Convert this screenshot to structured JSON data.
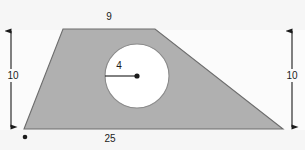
{
  "figure": {
    "canvas": {
      "width": 305,
      "height": 150
    },
    "colors": {
      "background": "#f6f6f6",
      "background_band": "#fbfbfb",
      "shape_fill": "#b0b0b0",
      "shape_stroke": "#6d6d6d",
      "hole_fill": "#ffffff",
      "hole_stroke": "#8a8a8a",
      "annotation": "#1b1b1b"
    },
    "shape": {
      "name": "trapezoid",
      "vertices": [
        {
          "x": 63,
          "y": 29
        },
        {
          "x": 155,
          "y": 29
        },
        {
          "x": 283,
          "y": 129
        },
        {
          "x": 24,
          "y": 129
        }
      ]
    },
    "hole": {
      "name": "circle",
      "center": {
        "x": 137,
        "y": 76
      },
      "radius_px": 32
    },
    "radius_line": {
      "from": {
        "x": 105,
        "y": 76
      },
      "to": {
        "x": 137,
        "y": 76
      }
    },
    "center_dot": {
      "x": 137,
      "y": 76,
      "r": 2.6
    },
    "corner_dot": {
      "x": 25,
      "y": 137,
      "r": 2.3
    },
    "dimensions": {
      "top": {
        "label": "9",
        "label_pos": {
          "x": 109,
          "y": 20
        }
      },
      "left": {
        "label": "10",
        "label_pos": {
          "x": 13,
          "y": 79
        },
        "line": {
          "x": 11,
          "y1": 29,
          "y2": 129
        }
      },
      "right": {
        "label": "10",
        "label_pos": {
          "x": 292,
          "y": 79
        },
        "line": {
          "x": 292,
          "y1": 29,
          "y2": 129
        }
      },
      "bottom": {
        "label": "25",
        "label_pos": {
          "x": 110,
          "y": 142
        }
      },
      "radius": {
        "label": "4",
        "label_pos": {
          "x": 119,
          "y": 69
        }
      }
    }
  }
}
